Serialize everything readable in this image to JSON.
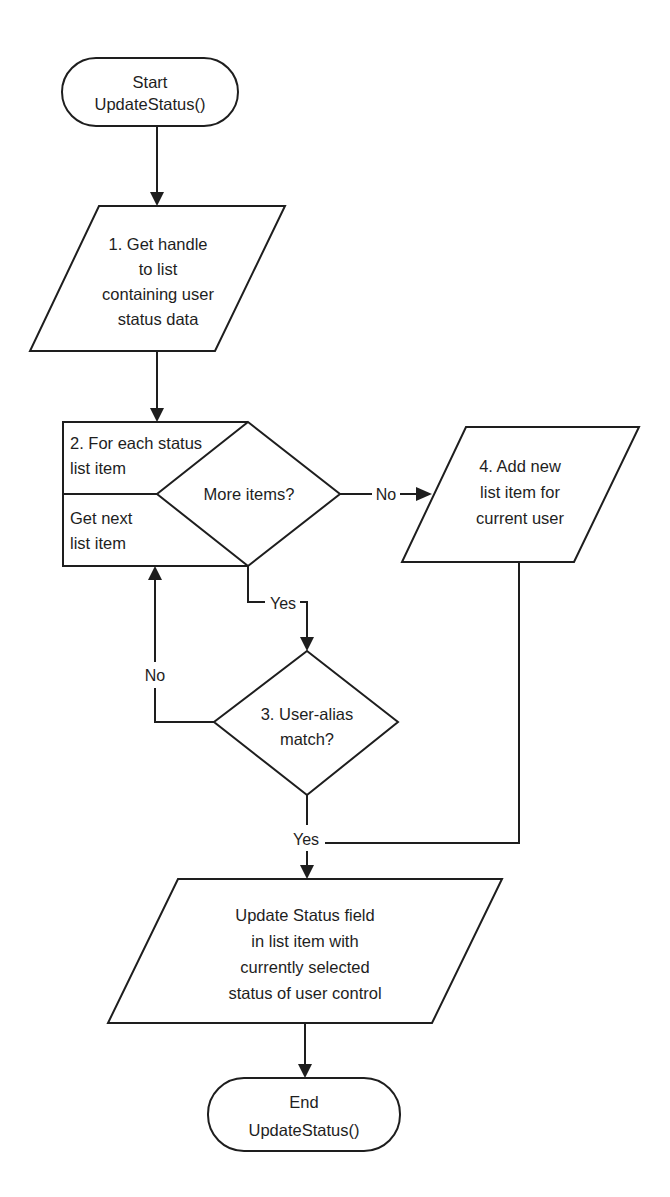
{
  "diagram": {
    "type": "flowchart",
    "nodes": {
      "start": {
        "shape": "terminal",
        "lines": [
          "Start",
          "UpdateStatus()"
        ]
      },
      "step1": {
        "shape": "parallelogram",
        "lines": [
          "1. Get handle",
          "to list",
          "containing user",
          "status data"
        ]
      },
      "step2": {
        "shape": "loop-box",
        "top_lines": [
          "2. For each status",
          "list item"
        ],
        "bottom_lines": [
          "Get next",
          "list item"
        ]
      },
      "more_items": {
        "shape": "decision",
        "lines": [
          "More items?"
        ]
      },
      "step3": {
        "shape": "decision",
        "lines": [
          "3. User-alias",
          "match?"
        ]
      },
      "step4": {
        "shape": "parallelogram",
        "lines": [
          "4. Add new",
          "list item for",
          "current user"
        ]
      },
      "update": {
        "shape": "parallelogram",
        "lines": [
          "Update Status field",
          "in list item with",
          "currently selected",
          "status of user control"
        ]
      },
      "end": {
        "shape": "terminal",
        "lines": [
          "End",
          "UpdateStatus()"
        ]
      }
    },
    "edges": {
      "more_no": "No",
      "more_yes": "Yes",
      "match_no": "No",
      "match_yes": "Yes"
    },
    "colors": {
      "stroke": "#1e1e1e",
      "fill": "#ffffff",
      "background": "#ffffff"
    }
  }
}
